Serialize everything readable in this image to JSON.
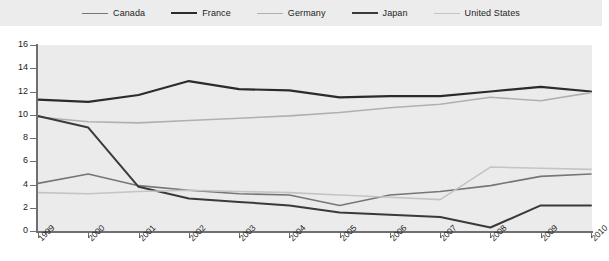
{
  "legend": {
    "position": "top",
    "items": [
      {
        "label": "Canada",
        "color": "#767676",
        "width": 1.6
      },
      {
        "label": "France",
        "color": "#2b2b2b",
        "width": 2.2
      },
      {
        "label": "Germany",
        "color": "#b0b0b0",
        "width": 1.6
      },
      {
        "label": "Japan",
        "color": "#3a3a3a",
        "width": 2.0
      },
      {
        "label": "United States",
        "color": "#c4c4c4",
        "width": 1.6
      }
    ]
  },
  "axes": {
    "y_ticks": [
      "0",
      "2",
      "4",
      "6",
      "8",
      "10",
      "12",
      "14",
      "16"
    ],
    "x_ticks": [
      "1999",
      "2000",
      "2001",
      "2002",
      "2003",
      "2004",
      "2005",
      "2006",
      "2007",
      "2008",
      "2009",
      "2010"
    ]
  },
  "chart_data": {
    "type": "line",
    "title": "",
    "subtitle": "",
    "xlabel": "",
    "ylabel": "",
    "xlim": [
      1999,
      2010
    ],
    "ylim": [
      0,
      16
    ],
    "ytick_step": 2,
    "grid": false,
    "legend_position": "top",
    "x": [
      "1999",
      "2000",
      "2001",
      "2002",
      "2003",
      "2004",
      "2005",
      "2006",
      "2007",
      "2008",
      "2009",
      "2010"
    ],
    "categories": [
      "1999",
      "2000",
      "2001",
      "2002",
      "2003",
      "2004",
      "2005",
      "2006",
      "2007",
      "2008",
      "2009",
      "2010"
    ],
    "series": [
      {
        "name": "Canada",
        "color": "#767676",
        "width": 1.6,
        "values": [
          4.1,
          4.9,
          3.9,
          3.5,
          3.2,
          3.1,
          2.2,
          3.1,
          3.4,
          3.9,
          4.7,
          4.9
        ]
      },
      {
        "name": "France",
        "color": "#2b2b2b",
        "width": 2.2,
        "values": [
          11.3,
          11.1,
          11.7,
          12.9,
          12.2,
          12.1,
          11.5,
          11.6,
          11.6,
          12.0,
          12.4,
          12.0
        ]
      },
      {
        "name": "Germany",
        "color": "#b0b0b0",
        "width": 1.6,
        "values": [
          9.8,
          9.4,
          9.3,
          9.5,
          9.7,
          9.9,
          10.2,
          10.6,
          10.9,
          11.5,
          11.2,
          11.9
        ]
      },
      {
        "name": "Japan",
        "color": "#3a3a3a",
        "width": 2.0,
        "values": [
          9.9,
          8.9,
          3.8,
          2.8,
          2.5,
          2.2,
          1.6,
          1.4,
          1.2,
          0.3,
          2.2,
          2.2
        ]
      },
      {
        "name": "United States",
        "color": "#c4c4c4",
        "width": 1.6,
        "values": [
          3.3,
          3.2,
          3.4,
          3.5,
          3.4,
          3.3,
          3.1,
          2.9,
          2.7,
          5.5,
          5.4,
          5.3
        ]
      }
    ]
  }
}
